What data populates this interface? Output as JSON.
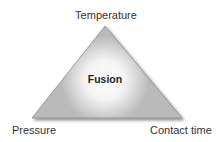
{
  "diagram": {
    "type": "triangle",
    "center_label": "Fusion",
    "vertices": {
      "top": "Temperature",
      "bottom_left": "Pressure",
      "bottom_right": "Contact time"
    },
    "colors": {
      "fill": "#b9b9b9",
      "edge": "#8a8a8a",
      "glow": "#ffffff",
      "text": "#333333"
    }
  }
}
